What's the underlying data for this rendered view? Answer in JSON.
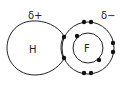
{
  "diagram": {
    "labels": {
      "partial_positive": "δ+",
      "partial_negative": "δ−",
      "hydrogen": "H",
      "fluorine": "F"
    },
    "colors": {
      "stroke": "#222222",
      "background": "#ffffff"
    },
    "electrons": {
      "shared_pair": 2,
      "fluorine_inner_shell": 2,
      "fluorine_outer_lone_pairs": 3
    }
  }
}
